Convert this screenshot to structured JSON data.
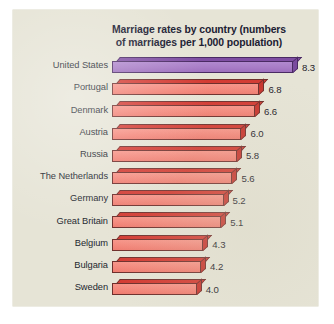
{
  "chart_data": {
    "type": "bar",
    "orientation": "horizontal",
    "title": "Marriage rates by country (numbers of marriages per 1,000 population)",
    "title_lines": [
      "Marriage rates by country (numbers",
      "of marriages per 1,000 population)"
    ],
    "xlabel": "",
    "ylabel": "",
    "xlim": [
      0,
      8.3
    ],
    "grid": false,
    "legend": "none",
    "categories": [
      "United States",
      "Portugal",
      "Denmark",
      "Austria",
      "Russia",
      "The Netherlands",
      "Germany",
      "Great Britain",
      "Belgium",
      "Bulgaria",
      "Sweden"
    ],
    "values": [
      8.3,
      6.8,
      6.6,
      6.0,
      5.8,
      5.6,
      5.2,
      5.1,
      4.3,
      4.2,
      4.0
    ],
    "value_labels": [
      "8.3",
      "6.8",
      "6.6",
      "6.0",
      "5.8",
      "5.6",
      "5.2",
      "5.1",
      "4.3",
      "4.2",
      "4.0"
    ],
    "highlight_index": 0,
    "colors": {
      "background": "#e6e4d6",
      "bar_front": "#f4887c",
      "bar_top": "#d33b33",
      "bar_side": "#c8352e",
      "bar_outline": "#6e2f2c",
      "highlight_front": "#a87cc6",
      "highlight_top": "#7f4fa3",
      "highlight_side": "#7a4a9e",
      "text": "#1d2029"
    }
  }
}
